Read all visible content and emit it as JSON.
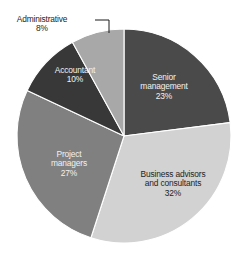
{
  "chart_data": {
    "type": "pie",
    "title": "",
    "subtitle": "",
    "xlabel": "",
    "ylabel": "",
    "legend_position": "none",
    "grid": false,
    "value_unit": "%",
    "total": 100,
    "categories": [
      "Senior management",
      "Business advisors and consultants",
      "Project managers",
      "Accountant",
      "Administrative"
    ],
    "values": [
      23,
      32,
      27,
      10,
      8
    ],
    "slices": [
      {
        "label": "Senior management",
        "label_line1": "Senior",
        "label_line2": "management",
        "value": 23,
        "value_text": "23%",
        "color": "#4a4a4a",
        "label_style": "on-dark",
        "label_placement": "inside",
        "start_angle": 0,
        "end_angle": 82.8,
        "label_x": 164,
        "label_y": 73
      },
      {
        "label": "Business advisors and consultants",
        "label_line1": "Business advisors",
        "label_line2": "and consultants",
        "value": 32,
        "value_text": "32%",
        "color": "#d2d2d2",
        "label_style": "on-light",
        "label_placement": "inside",
        "start_angle": 82.8,
        "end_angle": 198.0,
        "label_x": 173,
        "label_y": 170
      },
      {
        "label": "Project managers",
        "label_line1": "Project",
        "label_line2": "managers",
        "value": 27,
        "value_text": "27%",
        "color": "#808080",
        "label_style": "on-dark",
        "label_placement": "inside",
        "start_angle": 198.0,
        "end_angle": 295.2,
        "label_x": 69,
        "label_y": 150
      },
      {
        "label": "Accountant",
        "label_line1": "Accountant",
        "label_line2": "",
        "value": 10,
        "value_text": "10%",
        "color": "#383838",
        "label_style": "on-dark",
        "label_placement": "inside",
        "start_angle": 295.2,
        "end_angle": 331.2,
        "label_x": 75,
        "label_y": 66
      },
      {
        "label": "Administrative",
        "label_line1": "Administrative",
        "label_line2": "",
        "value": 8,
        "value_text": "8%",
        "color": "#a8a8a8",
        "label_style": "on-light",
        "label_placement": "callout",
        "start_angle": 331.2,
        "end_angle": 360,
        "label_x": 42,
        "label_y": 15
      }
    ],
    "geometry": {
      "center_x": 124,
      "center_y": 136,
      "radius": 107
    }
  }
}
